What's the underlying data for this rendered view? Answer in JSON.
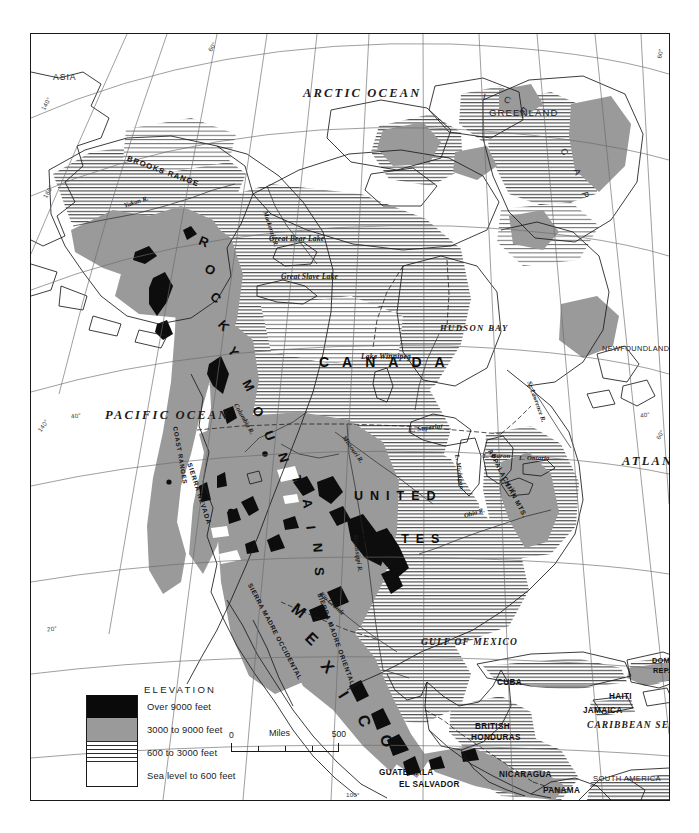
{
  "map": {
    "type": "physical-relief-map",
    "region": "North America",
    "projection_graticule": true
  },
  "legend": {
    "title": "ELEVATION",
    "entries": [
      {
        "swatch": "black",
        "label": "Over 9000 feet",
        "color": "#0a0a0a"
      },
      {
        "swatch": "gray",
        "label": "3000 to 9000 feet",
        "color": "#9a9a9a"
      },
      {
        "swatch": "hatch",
        "label": "600 to 3000 feet",
        "color": "#2b2b2b"
      },
      {
        "swatch": "white",
        "label": "Sea level to 600 feet",
        "color": "#ffffff"
      }
    ]
  },
  "scale": {
    "zero": "0",
    "unit": "Miles",
    "max": "500"
  },
  "oceans": [
    {
      "name": "ARCTIC OCEAN",
      "x": 272,
      "y": 52,
      "size": 12.5
    },
    {
      "name": "PACIFIC OCEAN",
      "x": 74,
      "y": 376,
      "size": 12.5
    },
    {
      "name": "ATLANTIC OCEAN",
      "x": 599,
      "y": 421,
      "size": 12.5
    },
    {
      "name": "CARIBBEAN SEA",
      "x": 567,
      "y": 690,
      "size": 10.5
    },
    {
      "name": "GULF OF MEXICO",
      "x": 393,
      "y": 607,
      "size": 10.0
    },
    {
      "name": "HUDSON BAY",
      "x": 413,
      "y": 291,
      "size": 8.8
    }
  ],
  "continents": [
    {
      "name": "CANADA",
      "x": 290,
      "y": 324,
      "spacing": 13
    },
    {
      "name": "UNITED",
      "x": 324,
      "y": 460,
      "spacing": 7
    },
    {
      "name": "STATES",
      "x": 328,
      "y": 503,
      "spacing": 7
    },
    {
      "name": "ASIA",
      "x": 46,
      "y": 68
    },
    {
      "name": "GREENLAND",
      "x": 478,
      "y": 106
    },
    {
      "name": "NEWFOUNDLAND",
      "x": 602,
      "y": 345
    },
    {
      "name": "SOUTH AMERICA",
      "x": 594,
      "y": 775
    }
  ],
  "ice_cap": {
    "letters": [
      "I",
      "C",
      "E",
      "C",
      "A",
      "P"
    ],
    "label": "ICE CAP"
  },
  "mexico_letters": [
    "M",
    "E",
    "X",
    "I",
    "C",
    "O"
  ],
  "rocky_letters": [
    "R",
    "O",
    "C",
    "K",
    "Y",
    "M",
    "O",
    "U",
    "N",
    "T",
    "A",
    "I",
    "N",
    "S"
  ],
  "countries": [
    {
      "name": "CUBA",
      "x": 485,
      "y": 648
    },
    {
      "name": "HAITI",
      "x": 596,
      "y": 662
    },
    {
      "name": "JAMAICA",
      "x": 578,
      "y": 676
    },
    {
      "name": "DOM.",
      "x": 639,
      "y": 627
    },
    {
      "name": "REP.",
      "x": 640,
      "y": 637
    },
    {
      "name": "BRITISH",
      "x": 472,
      "y": 695
    },
    {
      "name": "HONDURAS",
      "x": 470,
      "y": 705
    },
    {
      "name": "GUATEMALA",
      "x": 383,
      "y": 739
    },
    {
      "name": "EL SALVADOR",
      "x": 404,
      "y": 750
    },
    {
      "name": "NICARAGUA",
      "x": 497,
      "y": 740
    },
    {
      "name": "PANAMA",
      "x": 542,
      "y": 756
    },
    {
      "name": "COSTA RICA",
      "x": 468,
      "y": 777
    }
  ],
  "water_features": [
    {
      "name": "Great Bear Lake",
      "x": 271,
      "y": 233,
      "rot": 0
    },
    {
      "name": "Great Slave Lake",
      "x": 285,
      "y": 268,
      "rot": 0
    },
    {
      "name": "Lake Winnipeg",
      "x": 364,
      "y": 351,
      "rot": 0
    },
    {
      "name": "L. Superior",
      "x": 409,
      "y": 392,
      "rot": -8
    },
    {
      "name": "L. Michigan",
      "x": 442,
      "y": 428,
      "rot": 80
    },
    {
      "name": "L. Huron",
      "x": 464,
      "y": 424,
      "rot": 0
    },
    {
      "name": "L. Erie",
      "x": 483,
      "y": 448,
      "rot": 38
    },
    {
      "name": "L. Ontario",
      "x": 505,
      "y": 425,
      "rot": 0
    }
  ],
  "rivers": [
    {
      "name": "Yukon R.",
      "x": 104,
      "y": 172,
      "rot": -20
    },
    {
      "name": "Mackenzie R.",
      "x": 240,
      "y": 200,
      "rot": 72
    },
    {
      "name": "Columbia R.",
      "x": 218,
      "y": 382,
      "rot": 62
    },
    {
      "name": "Missouri R.",
      "x": 352,
      "y": 432,
      "rot": 57
    },
    {
      "name": "Mississippi R.",
      "x": 308,
      "y": 520,
      "rot": 80
    },
    {
      "name": "Ohio R.",
      "x": 452,
      "y": 490,
      "rot": -18
    },
    {
      "name": "St. Lawrence R.",
      "x": 530,
      "y": 372,
      "rot": 70
    },
    {
      "name": "Rio Grande",
      "x": 343,
      "y": 586,
      "rot": 40
    }
  ],
  "mountain_ranges": [
    {
      "name": "BROOKS RANGE",
      "x": 127,
      "y": 157,
      "rot": 18
    },
    {
      "name": "SIERRA NEVADA",
      "x": 191,
      "y": 460,
      "rot": 72
    },
    {
      "name": "COAST RANGES",
      "x": 177,
      "y": 432,
      "rot": 80
    },
    {
      "name": "SIERRA MADRE OCCIDENTAL",
      "x": 268,
      "y": 585,
      "rot": 62
    },
    {
      "name": "SIERRA MADRE ORIENTAL",
      "x": 330,
      "y": 592,
      "rot": 68
    },
    {
      "name": "APPALACHIAN MTS.",
      "x": 490,
      "y": 452,
      "rot": 62
    }
  ],
  "graticule_labels": [
    {
      "text": "140°",
      "x": 36,
      "y": 100,
      "rot": -62
    },
    {
      "text": "160°",
      "x": 38,
      "y": 188,
      "rot": -60
    },
    {
      "text": "140°",
      "x": 33,
      "y": 421,
      "rot": -55
    },
    {
      "text": "40°",
      "x": 68,
      "y": 411,
      "rot": -7
    },
    {
      "text": "20°",
      "x": 44,
      "y": 624,
      "rot": -7
    },
    {
      "text": "60°",
      "x": 206,
      "y": 42,
      "rot": -58
    },
    {
      "text": "60°",
      "x": 654,
      "y": 49,
      "rot": -80
    },
    {
      "text": "40°",
      "x": 639,
      "y": 410,
      "rot": -8
    },
    {
      "text": "60°",
      "x": 654,
      "y": 430,
      "rot": -62
    },
    {
      "text": "100°",
      "x": 345,
      "y": 790,
      "rot": 0
    },
    {
      "text": "80°",
      "x": 555,
      "y": 786,
      "rot": 0
    }
  ]
}
